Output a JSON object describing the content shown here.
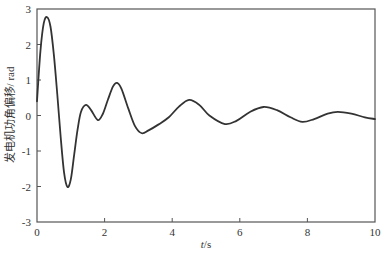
{
  "chart_data": {
    "type": "line",
    "title": "",
    "xlabel": "t/s",
    "ylabel": "发电机功角偏移/ rad",
    "xlim": [
      0,
      10
    ],
    "ylim": [
      -3,
      3
    ],
    "xticks": [
      0,
      2,
      4,
      6,
      8,
      10
    ],
    "yticks": [
      -3,
      -2,
      -1,
      0,
      1,
      2,
      3
    ],
    "grid": false,
    "legend": null,
    "series": [
      {
        "name": "发电机功角偏移",
        "color": "#333333",
        "x": [
          0,
          0.1,
          0.2,
          0.3,
          0.4,
          0.5,
          0.6,
          0.7,
          0.8,
          0.9,
          1.0,
          1.1,
          1.2,
          1.3,
          1.45,
          1.6,
          1.8,
          1.95,
          2.1,
          2.25,
          2.37,
          2.5,
          2.7,
          2.9,
          3.1,
          3.3,
          3.6,
          3.9,
          4.2,
          4.5,
          4.8,
          5.1,
          5.56,
          5.9,
          6.3,
          6.7,
          7.1,
          7.5,
          7.85,
          8.2,
          8.6,
          8.9,
          9.3,
          9.7,
          10.0
        ],
        "y": [
          0.4,
          1.8,
          2.6,
          2.77,
          2.5,
          1.7,
          0.6,
          -0.6,
          -1.6,
          -2.01,
          -1.8,
          -1.1,
          -0.4,
          0.1,
          0.3,
          0.15,
          -0.13,
          0.05,
          0.45,
          0.82,
          0.92,
          0.75,
          0.2,
          -0.3,
          -0.5,
          -0.42,
          -0.25,
          -0.05,
          0.25,
          0.44,
          0.3,
          0.0,
          -0.24,
          -0.15,
          0.1,
          0.24,
          0.15,
          -0.05,
          -0.18,
          -0.1,
          0.05,
          0.1,
          0.05,
          -0.05,
          -0.1
        ]
      }
    ]
  },
  "axes": {
    "x_title": "t/s",
    "y_title": "发电机功角偏移/ rad",
    "x_tick_labels": [
      "0",
      "2",
      "4",
      "6",
      "8",
      "10"
    ],
    "y_tick_labels": [
      "3",
      "2",
      "1",
      "0",
      "-1",
      "-2",
      "-3"
    ]
  }
}
